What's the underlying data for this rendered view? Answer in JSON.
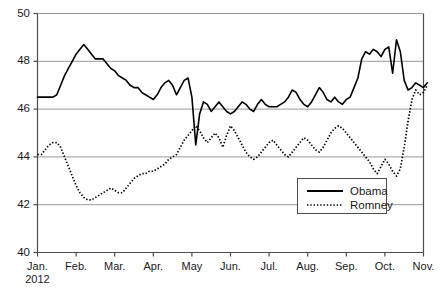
{
  "chart_data": {
    "type": "line",
    "title": "",
    "subtitle": "",
    "xlabel": "",
    "ylabel": "",
    "ylim": [
      40,
      50
    ],
    "yticks": [
      40,
      42,
      44,
      46,
      48,
      50
    ],
    "ytick_labels": [
      "40",
      "42",
      "44",
      "46",
      "48",
      "50"
    ],
    "grid": true,
    "grid_axis": "y",
    "legend_position": "bottom-right",
    "x_axis_type": "months",
    "xtick_labels": [
      "Jan.",
      "Feb.",
      "Mar.",
      "Apr.",
      "May",
      "Jun.",
      "Jul.",
      "Aug.",
      "Sep.",
      "Oct.",
      "Nov."
    ],
    "xtick_sublabels": [
      "2012",
      "",
      "",
      "",
      "",
      "",
      "",
      "",
      "",
      "",
      ""
    ],
    "x": [
      0.0,
      0.1,
      0.2,
      0.3,
      0.4,
      0.5,
      0.6,
      0.7,
      0.8,
      0.9,
      1.0,
      1.1,
      1.2,
      1.3,
      1.4,
      1.5,
      1.6,
      1.7,
      1.8,
      1.9,
      2.0,
      2.1,
      2.2,
      2.3,
      2.4,
      2.5,
      2.6,
      2.7,
      2.8,
      2.9,
      3.0,
      3.1,
      3.2,
      3.3,
      3.4,
      3.5,
      3.6,
      3.7,
      3.8,
      3.9,
      4.0,
      4.1,
      4.2,
      4.3,
      4.4,
      4.5,
      4.6,
      4.7,
      4.8,
      4.9,
      5.0,
      5.1,
      5.2,
      5.3,
      5.4,
      5.5,
      5.6,
      5.7,
      5.8,
      5.9,
      6.0,
      6.1,
      6.2,
      6.3,
      6.4,
      6.5,
      6.6,
      6.7,
      6.8,
      6.9,
      7.0,
      7.1,
      7.2,
      7.3,
      7.4,
      7.5,
      7.6,
      7.7,
      7.8,
      7.9,
      8.0,
      8.1,
      8.2,
      8.3,
      8.4,
      8.5,
      8.6,
      8.7,
      8.8,
      8.9,
      9.0,
      9.1,
      9.2,
      9.3,
      9.4,
      9.5,
      9.6,
      9.7,
      9.8,
      9.9,
      10.0,
      10.1
    ],
    "series": [
      {
        "name": "Obama",
        "style": "solid",
        "color": "#000000",
        "values": [
          46.5,
          46.5,
          46.5,
          46.5,
          46.5,
          46.6,
          47.0,
          47.4,
          47.7,
          48.0,
          48.3,
          48.5,
          48.7,
          48.5,
          48.3,
          48.1,
          48.1,
          48.1,
          47.9,
          47.7,
          47.6,
          47.4,
          47.3,
          47.2,
          47.0,
          46.9,
          46.9,
          46.7,
          46.6,
          46.5,
          46.4,
          46.6,
          46.9,
          47.1,
          47.2,
          47.0,
          46.6,
          46.9,
          47.2,
          47.3,
          46.5,
          44.5,
          45.8,
          46.3,
          46.2,
          45.9,
          46.1,
          46.3,
          46.1,
          45.9,
          45.8,
          45.9,
          46.1,
          46.3,
          46.2,
          46.0,
          45.9,
          46.2,
          46.4,
          46.2,
          46.1,
          46.1,
          46.1,
          46.2,
          46.3,
          46.5,
          46.8,
          46.7,
          46.4,
          46.2,
          46.1,
          46.3,
          46.6,
          46.9,
          46.7,
          46.4,
          46.3,
          46.5,
          46.3,
          46.2,
          46.4,
          46.5,
          46.9,
          47.3,
          48.1,
          48.4,
          48.3,
          48.5,
          48.4,
          48.2,
          48.5,
          48.6,
          47.5,
          48.9,
          48.4,
          47.2,
          46.8,
          46.9,
          47.1,
          47.0,
          46.9,
          47.1
        ]
      },
      {
        "name": "Romney",
        "style": "dotted",
        "color": "#000000",
        "values": [
          44.1,
          44.1,
          44.3,
          44.5,
          44.6,
          44.6,
          44.4,
          44.0,
          43.6,
          43.2,
          42.8,
          42.5,
          42.3,
          42.2,
          42.2,
          42.3,
          42.4,
          42.5,
          42.6,
          42.7,
          42.6,
          42.5,
          42.5,
          42.7,
          42.9,
          43.1,
          43.2,
          43.3,
          43.3,
          43.4,
          43.4,
          43.5,
          43.6,
          43.7,
          43.9,
          44.0,
          44.1,
          44.4,
          44.7,
          44.9,
          45.1,
          45.3,
          45.1,
          44.8,
          44.6,
          44.8,
          45.0,
          44.8,
          44.4,
          44.9,
          45.3,
          45.1,
          44.8,
          44.5,
          44.2,
          44.0,
          43.9,
          44.0,
          44.2,
          44.4,
          44.6,
          44.7,
          44.5,
          44.3,
          44.1,
          44.0,
          44.2,
          44.4,
          44.6,
          44.8,
          44.7,
          44.5,
          44.3,
          44.2,
          44.4,
          44.7,
          45.0,
          45.2,
          45.3,
          45.2,
          45.0,
          44.8,
          44.6,
          44.4,
          44.2,
          44.0,
          43.8,
          43.5,
          43.3,
          43.6,
          43.9,
          43.7,
          43.4,
          43.2,
          43.5,
          44.4,
          45.5,
          46.4,
          46.8,
          46.6,
          46.7,
          47.0
        ]
      }
    ],
    "annotations": []
  },
  "legend": {
    "entries": [
      {
        "label": "Obama",
        "style": "solid"
      },
      {
        "label": "Romney",
        "style": "dotted"
      }
    ]
  }
}
